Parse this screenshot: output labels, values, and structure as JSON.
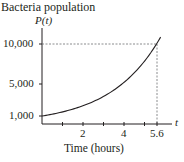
{
  "chart_data": {
    "type": "line",
    "title": "Bacteria population",
    "ylabel": "P(t)",
    "xlabel": "Time (hours)",
    "x_axis_symbol": "t",
    "xlim": [
      0,
      6.2
    ],
    "ylim": [
      0,
      11000
    ],
    "x_ticks": [
      1,
      2,
      3,
      4,
      5,
      5.6
    ],
    "x_tick_labels": [
      "2",
      "4",
      "5.6"
    ],
    "x_tick_label_values": [
      2,
      4,
      5.6
    ],
    "y_tick_labels": [
      "1,000",
      "5,000",
      "10,000"
    ],
    "y_tick_values": [
      1000,
      5000,
      10000
    ],
    "series": [
      {
        "name": "P(t)",
        "x": [
          0,
          1,
          2,
          3,
          4,
          5,
          5.6,
          5.8
        ],
        "values": [
          1000,
          1509,
          2276,
          3433,
          5179,
          7813,
          10000,
          10857
        ]
      }
    ],
    "annotations": [
      {
        "type": "dashed-guide",
        "point": [
          5.6,
          10000
        ]
      }
    ],
    "grid": false
  }
}
